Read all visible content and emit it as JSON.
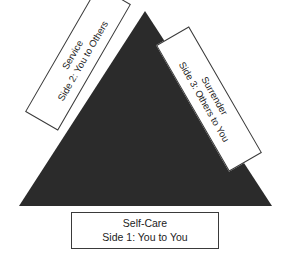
{
  "diagram": {
    "shape": {
      "name": "filled-triangle",
      "fill_color": "#2b2b2b",
      "apex": {
        "x": 145,
        "y": 11
      },
      "bottom_left": {
        "x": 19,
        "y": 206
      },
      "bottom_right": {
        "x": 272,
        "y": 206
      }
    },
    "background_color": "#ffffff",
    "border_color": "#3a3a3a",
    "text_color": "#1c1c1c",
    "labels": {
      "bottom": {
        "name": "Self-Care",
        "side": "Side 1: You to You",
        "rotation_degrees": 0
      },
      "left": {
        "name": "Service",
        "side": "Side 2: You to Others",
        "rotation_degrees": -60
      },
      "right": {
        "name": "Surrender",
        "side": "Side 3: Others to You",
        "rotation_degrees": 60
      }
    }
  }
}
